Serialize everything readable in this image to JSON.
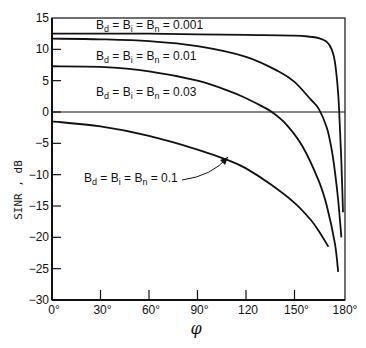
{
  "chart_data": {
    "type": "line",
    "title": "",
    "xlabel": "φ",
    "ylabel": "SINR , dB",
    "xlim": [
      0,
      180
    ],
    "ylim": [
      -30,
      15
    ],
    "grid": false,
    "x_ticks": [
      "0°",
      "30°",
      "60°",
      "90°",
      "120",
      "150°",
      "180°"
    ],
    "y_ticks": [
      "15",
      "10",
      "5",
      "0",
      "-5",
      "-10",
      "-15",
      "-20",
      "-25",
      "-30"
    ],
    "reference_line": {
      "y": 0
    },
    "series": [
      {
        "name": "B_d = B_i = B_n = 0.001",
        "label_parts": [
          "B",
          "d",
          " = B",
          "i",
          " = B",
          "n",
          " = 0.001"
        ],
        "x": [
          0,
          30,
          60,
          90,
          120,
          150,
          160,
          165,
          170,
          173,
          175,
          177,
          178,
          179,
          180
        ],
        "y": [
          12.5,
          12.5,
          12.5,
          12.4,
          12.3,
          12.2,
          12.0,
          11.8,
          11.2,
          10.0,
          8.0,
          3.0,
          -2.0,
          -8.0,
          -16.0
        ]
      },
      {
        "name": "B_d = B_i = B_n = 0.01",
        "label_parts": [
          "B",
          "d",
          " = B",
          "i",
          " = B",
          "n",
          " = 0.01"
        ],
        "x": [
          0,
          30,
          60,
          90,
          120,
          140,
          150,
          160,
          165,
          170,
          173,
          175,
          177,
          179
        ],
        "y": [
          11.7,
          11.6,
          11.3,
          10.5,
          8.8,
          6.5,
          4.8,
          2.0,
          0.5,
          -2.5,
          -6.0,
          -9.5,
          -14.0,
          -20.0
        ]
      },
      {
        "name": "B_d = B_i = B_n = 0.03",
        "label_parts": [
          "B",
          "d",
          " = B",
          "i",
          " = B",
          "n",
          " = 0.03"
        ],
        "x": [
          0,
          30,
          60,
          90,
          110,
          120,
          130,
          136,
          145,
          155,
          165,
          170,
          175,
          177
        ],
        "y": [
          7.3,
          7.2,
          6.5,
          5.0,
          3.3,
          2.2,
          0.9,
          0.0,
          -2.0,
          -5.5,
          -11.0,
          -15.0,
          -21.0,
          -25.5
        ]
      },
      {
        "name": "B_d = B_i = B_n = 0.1",
        "label_parts": [
          "B",
          "d",
          " = B",
          "i",
          " = B",
          "n",
          " = 0.1"
        ],
        "x": [
          0,
          30,
          60,
          90,
          110,
          120,
          135,
          150,
          160,
          165,
          171
        ],
        "y": [
          -1.5,
          -2.3,
          -3.8,
          -6.0,
          -7.8,
          -9.0,
          -11.5,
          -14.5,
          -17.2,
          -19.0,
          -21.5
        ]
      }
    ],
    "annotations": [
      {
        "text": "B_d = B_i = B_n = 0.1",
        "arrow_to_series": "B_d = B_i = B_n = 0.1"
      }
    ]
  }
}
